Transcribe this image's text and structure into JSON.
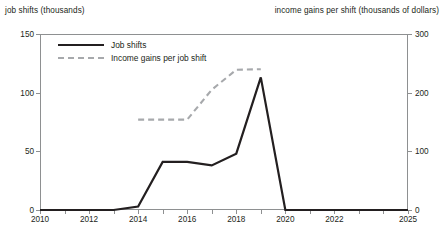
{
  "axis_titles": {
    "left": "job shifts (thousands)",
    "right": "income gains per shift (thousands of dollars)"
  },
  "legend": {
    "items": [
      {
        "label": "Job shifts",
        "style": "solid",
        "color": "#231f20"
      },
      {
        "label": "Income gains per job shift",
        "style": "dashed",
        "color": "#a7a9ac"
      }
    ]
  },
  "ticks": {
    "left": [
      "0",
      "50",
      "100",
      "150"
    ],
    "right": [
      "0",
      "100",
      "200",
      "300"
    ],
    "x": [
      "2010",
      "2012",
      "2014",
      "2016",
      "2018",
      "2020",
      "2022",
      "2025"
    ]
  },
  "chart_data": {
    "type": "line",
    "title": "",
    "xlabel": "",
    "ylabel": "job shifts (thousands)",
    "ylabel_right": "income gains per shift (thousands of dollars)",
    "xlim": [
      2010,
      2025
    ],
    "ylim": [
      0,
      150
    ],
    "ylim_right": [
      0,
      300
    ],
    "grid": false,
    "legend_position": "top-left",
    "x_tick_labels": [
      "2010",
      "2012",
      "2014",
      "2016",
      "2018",
      "2020",
      "2022",
      "2025"
    ],
    "x_tick_values": [
      2010,
      2012,
      2014,
      2016,
      2018,
      2020,
      2022,
      2025
    ],
    "y_tick_values_left": [
      0,
      50,
      100,
      150
    ],
    "y_tick_values_right": [
      0,
      100,
      200,
      300
    ],
    "series": [
      {
        "name": "Job shifts",
        "axis": "left",
        "style": "solid",
        "color": "#231f20",
        "x": [
          2010,
          2011,
          2012,
          2013,
          2014,
          2015,
          2016,
          2017,
          2018,
          2019,
          2020,
          2021,
          2022,
          2023,
          2024,
          2025
        ],
        "values": [
          0,
          0,
          0,
          0,
          3,
          41,
          41,
          38,
          48,
          113,
          0,
          0,
          0,
          0,
          0,
          0
        ]
      },
      {
        "name": "Income gains per job shift",
        "axis": "right",
        "style": "dashed",
        "color": "#a7a9ac",
        "x": [
          2014,
          2015,
          2016,
          2017,
          2018,
          2019
        ],
        "values": [
          154,
          154,
          154,
          205,
          239,
          240
        ]
      }
    ]
  }
}
